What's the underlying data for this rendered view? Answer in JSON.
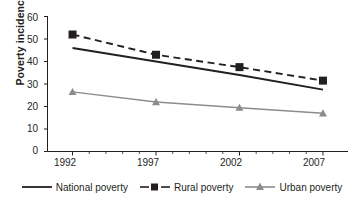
{
  "chart_data": {
    "type": "line",
    "title": "",
    "xlabel": "",
    "ylabel": "Poverty incidence (%)",
    "x": [
      1992,
      1997,
      2002,
      2007
    ],
    "categories": [
      "1992",
      "1997",
      "2002",
      "2007"
    ],
    "xlim": [
      1990.5,
      2008.5
    ],
    "ylim": [
      0,
      60
    ],
    "yticks": [
      0,
      10,
      20,
      30,
      40,
      50,
      60
    ],
    "ytick_labels": [
      "0",
      "10",
      "20",
      "30",
      "40",
      "50",
      "60"
    ],
    "xticks": [
      1992,
      1997,
      2002,
      2007
    ],
    "xtick_labels": [
      "1992",
      "1997",
      "2002",
      "2007"
    ],
    "x_minor_ticks": [
      1993,
      1994,
      1995,
      1996,
      1998,
      1999,
      2000,
      2001,
      2003,
      2004,
      2005,
      2006
    ],
    "grid": false,
    "legend_position": "bottom",
    "series": [
      {
        "name": "National poverty",
        "values": [
          46,
          40,
          34,
          27.5
        ],
        "color": "#231f20",
        "style": "solid",
        "marker": "none"
      },
      {
        "name": "Rural poverty",
        "values": [
          52,
          43,
          37.5,
          31.5
        ],
        "color": "#231f20",
        "style": "dashed",
        "marker": "square"
      },
      {
        "name": "Urban poverty",
        "values": [
          26.5,
          22,
          19.5,
          17
        ],
        "color": "#8c8c8c",
        "style": "solid",
        "marker": "triangle"
      }
    ]
  },
  "axis": {
    "y_title": "Poverty incidence (%)",
    "y_labels": [
      "60",
      "50",
      "40",
      "30",
      "20",
      "10",
      "0"
    ],
    "x_labels": [
      "1992",
      "1997",
      "2002",
      "2007"
    ]
  },
  "legend": {
    "items": [
      {
        "label": "National poverty",
        "key": "solid-line-key"
      },
      {
        "label": "Rural poverty",
        "key": "dashed-square-key"
      },
      {
        "label": "Urban poverty",
        "key": "gray-triangle-key"
      }
    ]
  },
  "colors": {
    "axis": "#231f20",
    "national": "#231f20",
    "rural": "#231f20",
    "urban": "#8c8c8c",
    "background": "#ffffff"
  }
}
